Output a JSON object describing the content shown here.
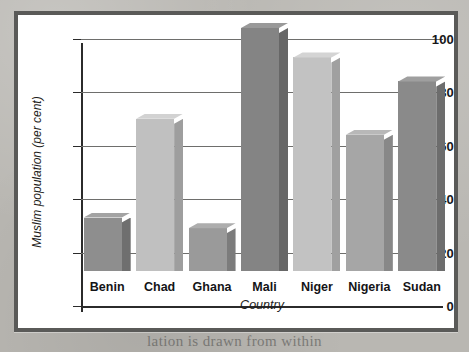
{
  "figure": {
    "frame_color": "#5a5a58",
    "plot_background": "#ffffff"
  },
  "chart_data": {
    "type": "bar",
    "title": "",
    "subtitle": "",
    "xlabel": "Country",
    "ylabel": "Muslim population (per cent)",
    "categories": [
      "Benin",
      "Chad",
      "Ghana",
      "Mali",
      "Niger",
      "Nigeria",
      "Sudan"
    ],
    "values": [
      20,
      57,
      16,
      91,
      80,
      51,
      71
    ],
    "series": [
      {
        "name": "Muslim population (per cent)",
        "values": [
          20,
          57,
          16,
          91,
          80,
          51,
          71
        ]
      }
    ],
    "bar_colors": [
      "#8e8e8e",
      "#c0c0c0",
      "#9a9a9a",
      "#848484",
      "#c2c2c2",
      "#a6a6a6",
      "#8a8a8a"
    ],
    "bar_side_colors": [
      "#6f6f6f",
      "#9e9e9e",
      "#7c7c7c",
      "#676767",
      "#a0a0a0",
      "#888888",
      "#6d6d6d"
    ],
    "bar_top_colors": [
      "#a3a3a3",
      "#d2d2d2",
      "#adadad",
      "#999999",
      "#d4d4d4",
      "#b8b8b8",
      "#9f9f9f"
    ],
    "ylim": [
      0,
      100
    ],
    "yticks": [
      0,
      20,
      40,
      60,
      80,
      100
    ],
    "ytick_labels": [
      "0",
      "20",
      "40",
      "60",
      "80",
      "100"
    ],
    "grid": true,
    "grid_color": "#6e6e6c",
    "legend": "none",
    "legend_position": "none",
    "style": "3d-bar",
    "annotations": []
  },
  "page_bleed_text": "lation is drawn from within"
}
